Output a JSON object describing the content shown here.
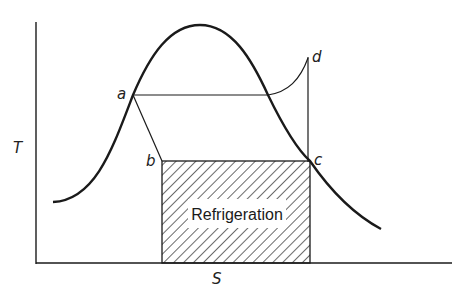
{
  "diagram": {
    "title": "",
    "type": "temperature-entropy diagram (refrigeration cycle)",
    "axes": {
      "y_label": "T",
      "x_label": "S"
    },
    "points": {
      "a": "a",
      "b": "b",
      "c": "c",
      "d": "d"
    },
    "region_label": "Refrigeration",
    "colors": {
      "line": "#1a1a1a",
      "background": "#ffffff"
    }
  }
}
